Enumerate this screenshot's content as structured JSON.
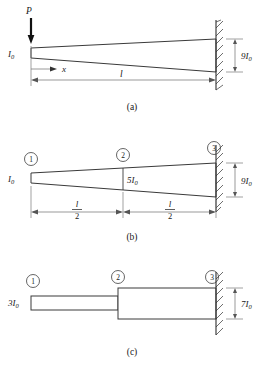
{
  "figure": {
    "background_color": "#ffffff",
    "line_color": "#3a3a3a",
    "dim_color": "#6e6e6e"
  },
  "panels": [
    {
      "id": "a",
      "caption": "(a)",
      "load_label": "P",
      "left_inertia_label": "I",
      "left_inertia_sub": "0",
      "coordinate_label": "x",
      "length_label": "l",
      "right_depth_label": "9I",
      "right_depth_sub": "0"
    },
    {
      "id": "b",
      "caption": "(b)",
      "left_inertia_label": "I",
      "left_inertia_sub": "0",
      "mid_inertia_label": "5I",
      "mid_inertia_sub": "0",
      "right_depth_label": "9I",
      "right_depth_sub": "0",
      "segment_length_numerator": "l",
      "segment_length_denominator": "2",
      "nodes": [
        {
          "number": "1"
        },
        {
          "number": "2"
        },
        {
          "number": "3"
        }
      ]
    },
    {
      "id": "c",
      "caption": "(c)",
      "left_inertia_label": "3I",
      "left_inertia_sub": "0",
      "right_depth_label": "7I",
      "right_depth_sub": "0",
      "nodes": [
        {
          "number": "1"
        },
        {
          "number": "2"
        },
        {
          "number": "3"
        }
      ]
    }
  ]
}
